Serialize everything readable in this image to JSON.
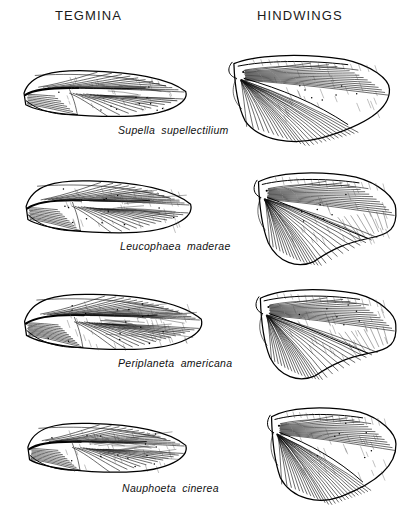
{
  "figure": {
    "type": "scientific-illustration",
    "background_color": "#ffffff",
    "ink_color": "#000000"
  },
  "headers": {
    "left": "TEGMINA",
    "right": "HINDWINGS"
  },
  "rows": [
    {
      "species": "Supella supellectilium",
      "label_left": 118,
      "label_top": 124,
      "tegmen": {
        "name": "tegmen-supella-supellectilium",
        "x": 18,
        "y": 63,
        "w": 172,
        "h": 58,
        "shape": "narrow-elongate-oval",
        "relative_size": "small"
      },
      "hindwing": {
        "name": "hindwing-supella-supellectilium",
        "x": 222,
        "y": 48,
        "w": 170,
        "h": 98,
        "shape": "fan-with-pointed-apex",
        "relative_size": "small"
      }
    },
    {
      "species": "Leucophaea maderae",
      "label_left": 120,
      "label_top": 240,
      "tegmen": {
        "name": "tegmen-leucophaea-maderae",
        "x": 20,
        "y": 172,
        "w": 175,
        "h": 66,
        "shape": "broad-oval",
        "relative_size": "medium"
      },
      "hindwing": {
        "name": "hindwing-leucophaea-maderae",
        "x": 248,
        "y": 165,
        "w": 150,
        "h": 105,
        "shape": "fan-with-apical-lobe",
        "relative_size": "medium"
      }
    },
    {
      "species": "Periplaneta americana",
      "label_left": 118,
      "label_top": 357,
      "tegmen": {
        "name": "tegmen-periplaneta-americana",
        "x": 18,
        "y": 285,
        "w": 188,
        "h": 70,
        "shape": "large-broad-oval-dense-venation",
        "relative_size": "large"
      },
      "hindwing": {
        "name": "hindwing-periplaneta-americana",
        "x": 250,
        "y": 282,
        "w": 148,
        "h": 102,
        "shape": "fan-with-large-apical-lobe",
        "relative_size": "large"
      }
    },
    {
      "species": "Nauphoeta cinerea",
      "label_left": 122,
      "label_top": 482,
      "tegmen": {
        "name": "tegmen-nauphoeta-cinerea",
        "x": 22,
        "y": 415,
        "w": 168,
        "h": 62,
        "shape": "rounded-oval",
        "relative_size": "medium"
      },
      "hindwing": {
        "name": "hindwing-nauphoeta-cinerea",
        "x": 262,
        "y": 400,
        "w": 136,
        "h": 105,
        "shape": "broad-rounded-fan",
        "relative_size": "medium"
      }
    }
  ]
}
